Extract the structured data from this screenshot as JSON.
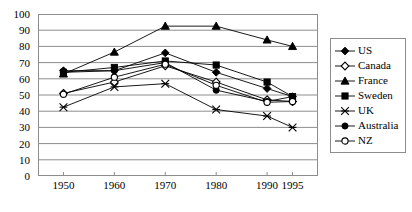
{
  "chart_data": {
    "type": "line",
    "title": "",
    "subtitle": "",
    "xlabel": "",
    "ylabel": "",
    "categories": [
      "1950",
      "1960",
      "1970",
      "1980",
      "1990",
      "1995"
    ],
    "x_positions": [
      1950,
      1960,
      1970,
      1980,
      1990,
      1995
    ],
    "xlim": [
      1945,
      2000
    ],
    "ylim": [
      0,
      100
    ],
    "y_ticks": [
      0,
      10,
      20,
      30,
      40,
      50,
      60,
      70,
      80,
      90,
      100
    ],
    "grid": "horizontal",
    "legend_position": "right",
    "series": [
      {
        "name": "US",
        "marker": "filled-diamond",
        "color": "#000000",
        "values": [
          65,
          65,
          76,
          64,
          54,
          49
        ]
      },
      {
        "name": "Canada",
        "marker": "open-diamond",
        "color": "#000000",
        "values": [
          51,
          58,
          68,
          58,
          47,
          46
        ]
      },
      {
        "name": "France",
        "marker": "filled-triangle",
        "color": "#000000",
        "values": [
          63,
          76.5,
          92.5,
          92.5,
          84,
          80
        ]
      },
      {
        "name": "Sweden",
        "marker": "filled-square",
        "color": "#000000",
        "values": [
          64,
          67,
          71,
          68.5,
          58,
          49
        ]
      },
      {
        "name": "UK",
        "marker": "cross",
        "color": "#000000",
        "values": [
          42.5,
          55,
          57,
          41,
          37,
          30
        ]
      },
      {
        "name": "Australia",
        "marker": "filled-circle",
        "color": "#000000",
        "values": [
          64,
          65,
          70,
          53,
          46,
          49
        ]
      },
      {
        "name": "NZ",
        "marker": "open-circle",
        "color": "#000000",
        "values": [
          50.5,
          61,
          69,
          56,
          45.5,
          46
        ]
      }
    ]
  },
  "axes": {
    "y_tick_labels": [
      "0",
      "10",
      "20",
      "30",
      "40",
      "50",
      "60",
      "70",
      "80",
      "90",
      "100"
    ],
    "x_tick_labels": [
      "1950",
      "1960",
      "1970",
      "1980",
      "1990",
      "1995"
    ]
  },
  "legend": {
    "entries": [
      {
        "label": "US",
        "marker": "filled-diamond"
      },
      {
        "label": "Canada",
        "marker": "open-diamond"
      },
      {
        "label": "France",
        "marker": "filled-triangle"
      },
      {
        "label": "Sweden",
        "marker": "filled-square"
      },
      {
        "label": "UK",
        "marker": "cross"
      },
      {
        "label": "Australia",
        "marker": "filled-circle"
      },
      {
        "label": "NZ",
        "marker": "open-circle"
      }
    ]
  },
  "style": {
    "line_color": "#000000",
    "grid_color": "#8d8d8d",
    "frame_color": "#8d8d8d",
    "background": "#ffffff"
  }
}
